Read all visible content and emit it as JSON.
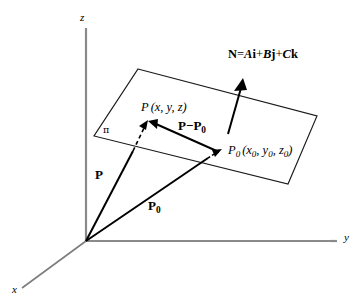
{
  "figure": {
    "background_color": "#ffffff",
    "ink_color": "#000000",
    "axis_color": "#8a8a8a"
  },
  "axes": {
    "z_label": "z",
    "y_label": "y",
    "x_label": "x"
  },
  "plane": {
    "symbol": "π",
    "edge_color": "#1a1a1a"
  },
  "points": {
    "p_label_main": "P",
    "p_label_coords": "(x, y, z)",
    "p0_label_main": "P",
    "p0_label_sub": "0",
    "p0_label_coords": "(x",
    "p0_coords_sub1": "0",
    "p0_coords_mid1": ", y",
    "p0_coords_sub2": "0",
    "p0_coords_mid2": ", z",
    "p0_coords_sub3": "0",
    "p0_coords_end": ")"
  },
  "vectors": {
    "p_label": "P",
    "p0_label_main": "P",
    "p0_label_sub": "0",
    "diff_label_main": "P",
    "diff_label_minus": "−",
    "diff_label_p": "P",
    "diff_label_sub": "0",
    "normal_name": "N",
    "normal_equals": "=",
    "normal_A": "A",
    "normal_i": "i",
    "normal_plus1": "+",
    "normal_B": "B",
    "normal_j": "j",
    "normal_plus2": "+",
    "normal_C": "C",
    "normal_k": "k"
  }
}
